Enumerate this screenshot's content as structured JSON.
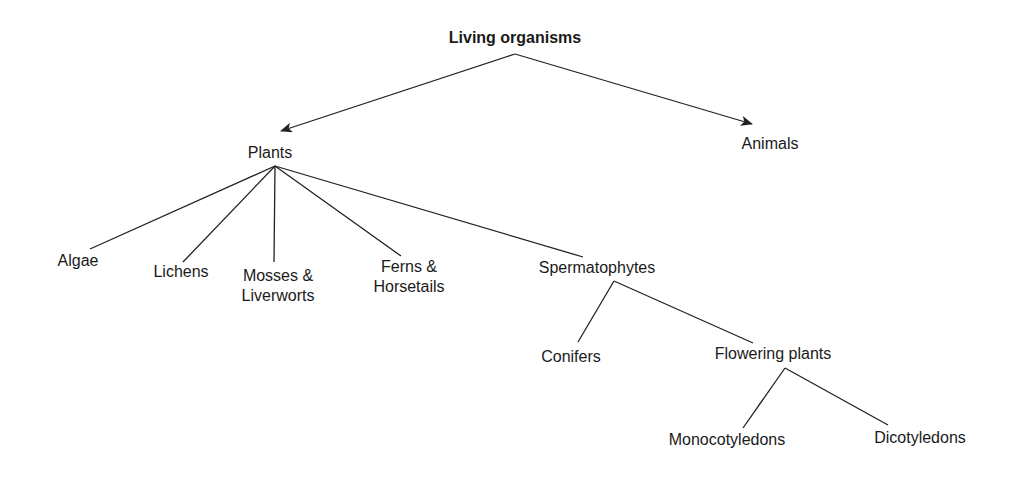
{
  "diagram": {
    "type": "tree",
    "line_color": "#222222",
    "root": {
      "label": "Living organisms"
    },
    "nodes": {
      "plants": {
        "label": "Plants"
      },
      "animals": {
        "label": "Animals"
      },
      "algae": {
        "label": "Algae"
      },
      "lichens": {
        "label": "Lichens"
      },
      "mosses": {
        "line1": "Mosses &",
        "line2": "Liverworts"
      },
      "ferns": {
        "line1": "Ferns &",
        "line2": "Horsetails"
      },
      "spermatophytes": {
        "label": "Spermatophytes"
      },
      "conifers": {
        "label": "Conifers"
      },
      "flowering": {
        "label": "Flowering plants"
      },
      "monocots": {
        "label": "Monocotyledons"
      },
      "dicots": {
        "label": "Dicotyledons"
      }
    },
    "edges": [
      [
        "Living organisms",
        "Plants",
        "arrow"
      ],
      [
        "Living organisms",
        "Animals",
        "arrow"
      ],
      [
        "Plants",
        "Algae"
      ],
      [
        "Plants",
        "Lichens"
      ],
      [
        "Plants",
        "Mosses & Liverworts"
      ],
      [
        "Plants",
        "Ferns & Horsetails"
      ],
      [
        "Plants",
        "Spermatophytes"
      ],
      [
        "Spermatophytes",
        "Conifers"
      ],
      [
        "Spermatophytes",
        "Flowering plants"
      ],
      [
        "Flowering plants",
        "Monocotyledons"
      ],
      [
        "Flowering plants",
        "Dicotyledons"
      ]
    ]
  }
}
